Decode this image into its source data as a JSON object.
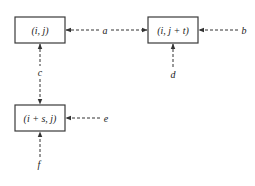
{
  "diagram": {
    "nodes": {
      "ij": {
        "label": "(i, j)"
      },
      "ijt": {
        "label": "(i, j + t)"
      },
      "isj": {
        "label": "(i + s, j)"
      }
    },
    "edges": {
      "a": {
        "label": "a",
        "from": "(i, j)",
        "to": "(i, j + t)",
        "direction": "bidirectional"
      },
      "b": {
        "label": "b",
        "to": "(i, j + t)",
        "direction": "incoming-from-right"
      },
      "c": {
        "label": "c",
        "from": "(i, j)",
        "to": "(i + s, j)",
        "direction": "bidirectional"
      },
      "d": {
        "label": "d",
        "to": "(i, j + t)",
        "direction": "incoming-from-below"
      },
      "e": {
        "label": "e",
        "to": "(i + s, j)",
        "direction": "incoming-from-right"
      },
      "f": {
        "label": "f",
        "to": "(i + s, j)",
        "direction": "incoming-from-below"
      }
    },
    "colors": {
      "stroke": "#333333",
      "box_border": "#3a3a3a",
      "text": "#222222",
      "background": "#ffffff"
    }
  }
}
